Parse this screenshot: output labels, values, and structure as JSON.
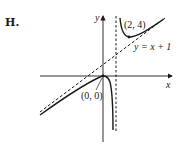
{
  "panel_label": "H.",
  "axes": {
    "x_label": "x",
    "y_label": "y"
  },
  "annotations": {
    "max_point": "(0, 0)",
    "min_point": "(2, 4)",
    "oblique_asymptote": "y = x + 1"
  },
  "graph": {
    "function": "y = x^2/(x-1)",
    "vertical_asymptote": "x = 1",
    "oblique_asymptote": "y = x + 1",
    "local_max": [
      0,
      0
    ],
    "local_min": [
      2,
      4
    ]
  }
}
